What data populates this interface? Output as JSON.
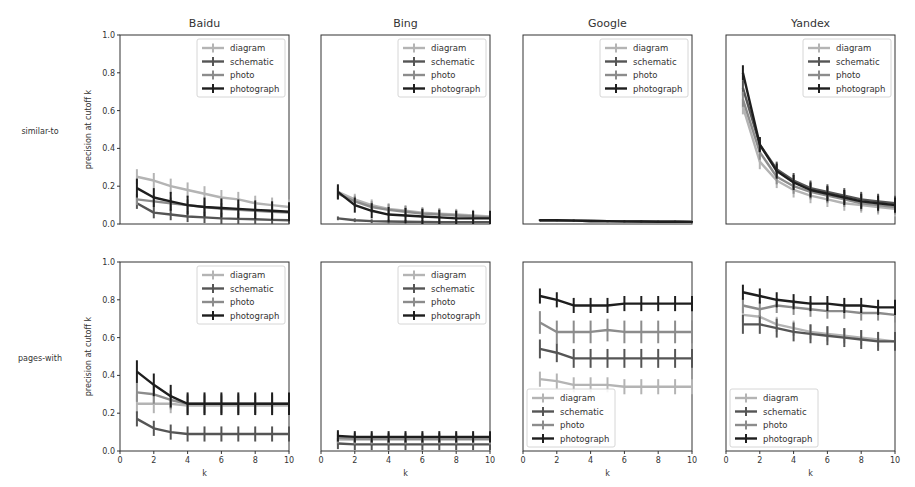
{
  "figure": {
    "row_labels": [
      "similar-to",
      "pages-with"
    ],
    "col_titles": [
      "Baidu",
      "Bing",
      "Google",
      "Yandex"
    ],
    "ylabel": "precision at cutoff k",
    "xlabel": "k",
    "yticks": [
      "0.0",
      "0.2",
      "0.4",
      "0.6",
      "0.8",
      "1.0"
    ],
    "xticks": [
      "0",
      "2",
      "4",
      "6",
      "8",
      "10"
    ]
  },
  "chart_data": {
    "type": "line",
    "layout": "grid 2 rows x 4 columns of errorbar line plots",
    "x": [
      1,
      2,
      3,
      4,
      5,
      6,
      7,
      8,
      9,
      10
    ],
    "xlim": [
      0,
      10
    ],
    "ylim": [
      0,
      1.0
    ],
    "grid": false,
    "series_names": [
      "diagram",
      "schematic",
      "photo",
      "photograph"
    ],
    "series_colors": {
      "diagram": "#b4b4b4",
      "schematic": "#555555",
      "photo": "#8c8c8c",
      "photograph": "#1e1e1e"
    },
    "panels": [
      {
        "row": "similar-to",
        "engine": "Baidu",
        "legend_position": "upper right",
        "series": [
          {
            "name": "diagram",
            "values": [
              0.25,
              0.23,
              0.2,
              0.18,
              0.16,
              0.14,
              0.13,
              0.11,
              0.1,
              0.09
            ],
            "err": 0.04
          },
          {
            "name": "schematic",
            "values": [
              0.11,
              0.06,
              0.05,
              0.04,
              0.035,
              0.03,
              0.027,
              0.025,
              0.022,
              0.02
            ],
            "err": 0.03
          },
          {
            "name": "photo",
            "values": [
              0.13,
              0.12,
              0.11,
              0.1,
              0.09,
              0.08,
              0.075,
              0.07,
              0.065,
              0.06
            ],
            "err": 0.03
          },
          {
            "name": "photograph",
            "values": [
              0.19,
              0.14,
              0.12,
              0.1,
              0.09,
              0.085,
              0.08,
              0.075,
              0.07,
              0.065
            ],
            "err": 0.05
          }
        ]
      },
      {
        "row": "similar-to",
        "engine": "Bing",
        "legend_position": "upper right",
        "series": [
          {
            "name": "diagram",
            "values": [
              0.17,
              0.13,
              0.1,
              0.08,
              0.07,
              0.06,
              0.055,
              0.05,
              0.045,
              0.04
            ],
            "err": 0.03
          },
          {
            "name": "schematic",
            "values": [
              0.03,
              0.02,
              0.015,
              0.013,
              0.012,
              0.011,
              0.01,
              0.01,
              0.01,
              0.01
            ],
            "err": 0.01
          },
          {
            "name": "photo",
            "values": [
              0.16,
              0.12,
              0.09,
              0.075,
              0.065,
              0.055,
              0.05,
              0.045,
              0.04,
              0.035
            ],
            "err": 0.03
          },
          {
            "name": "photograph",
            "values": [
              0.17,
              0.1,
              0.07,
              0.05,
              0.045,
              0.04,
              0.035,
              0.03,
              0.03,
              0.03
            ],
            "err": 0.04
          }
        ]
      },
      {
        "row": "similar-to",
        "engine": "Google",
        "legend_position": "upper right",
        "series": [
          {
            "name": "diagram",
            "values": [
              0.02,
              0.02,
              0.018,
              0.016,
              0.015,
              0.014,
              0.013,
              0.012,
              0.012,
              0.011
            ],
            "err": 0.005
          },
          {
            "name": "schematic",
            "values": [
              0.02,
              0.02,
              0.018,
              0.016,
              0.015,
              0.014,
              0.013,
              0.012,
              0.012,
              0.011
            ],
            "err": 0.005
          },
          {
            "name": "photo",
            "values": [
              0.02,
              0.02,
              0.018,
              0.016,
              0.015,
              0.014,
              0.013,
              0.012,
              0.012,
              0.011
            ],
            "err": 0.005
          },
          {
            "name": "photograph",
            "values": [
              0.02,
              0.02,
              0.018,
              0.016,
              0.015,
              0.014,
              0.013,
              0.012,
              0.012,
              0.011
            ],
            "err": 0.005
          }
        ]
      },
      {
        "row": "similar-to",
        "engine": "Yandex",
        "legend_position": "upper right",
        "series": [
          {
            "name": "diagram",
            "values": [
              0.62,
              0.33,
              0.23,
              0.18,
              0.15,
              0.13,
              0.11,
              0.1,
              0.09,
              0.08
            ],
            "err": 0.04
          },
          {
            "name": "schematic",
            "values": [
              0.72,
              0.42,
              0.29,
              0.23,
              0.19,
              0.17,
              0.15,
              0.13,
              0.12,
              0.11
            ],
            "err": 0.04
          },
          {
            "name": "photo",
            "values": [
              0.66,
              0.38,
              0.25,
              0.2,
              0.17,
              0.15,
              0.13,
              0.11,
              0.1,
              0.09
            ],
            "err": 0.04
          },
          {
            "name": "photograph",
            "values": [
              0.8,
              0.42,
              0.28,
              0.22,
              0.18,
              0.16,
              0.14,
              0.12,
              0.11,
              0.1
            ],
            "err": 0.04
          }
        ]
      },
      {
        "row": "pages-with",
        "engine": "Baidu",
        "legend_position": "upper right",
        "series": [
          {
            "name": "diagram",
            "values": [
              0.25,
              0.25,
              0.25,
              0.24,
              0.24,
              0.24,
              0.24,
              0.24,
              0.24,
              0.24
            ],
            "err": 0.05
          },
          {
            "name": "schematic",
            "values": [
              0.17,
              0.12,
              0.1,
              0.09,
              0.09,
              0.09,
              0.09,
              0.09,
              0.09,
              0.09
            ],
            "err": 0.04
          },
          {
            "name": "photo",
            "values": [
              0.31,
              0.3,
              0.27,
              0.25,
              0.25,
              0.25,
              0.25,
              0.25,
              0.25,
              0.25
            ],
            "err": 0.05
          },
          {
            "name": "photograph",
            "values": [
              0.42,
              0.35,
              0.29,
              0.25,
              0.25,
              0.25,
              0.25,
              0.25,
              0.25,
              0.25
            ],
            "err": 0.06
          }
        ]
      },
      {
        "row": "pages-with",
        "engine": "Bing",
        "legend_position": "upper right",
        "series": [
          {
            "name": "diagram",
            "values": [
              0.06,
              0.06,
              0.06,
              0.06,
              0.06,
              0.06,
              0.06,
              0.06,
              0.06,
              0.06
            ],
            "err": 0.03
          },
          {
            "name": "schematic",
            "values": [
              0.04,
              0.035,
              0.035,
              0.035,
              0.035,
              0.035,
              0.035,
              0.035,
              0.035,
              0.035
            ],
            "err": 0.03
          },
          {
            "name": "photo",
            "values": [
              0.07,
              0.065,
              0.065,
              0.065,
              0.065,
              0.065,
              0.065,
              0.065,
              0.065,
              0.065
            ],
            "err": 0.03
          },
          {
            "name": "photograph",
            "values": [
              0.08,
              0.075,
              0.075,
              0.075,
              0.075,
              0.075,
              0.075,
              0.075,
              0.075,
              0.075
            ],
            "err": 0.03
          }
        ]
      },
      {
        "row": "pages-with",
        "engine": "Google",
        "legend_position": "lower left",
        "series": [
          {
            "name": "diagram",
            "values": [
              0.38,
              0.37,
              0.35,
              0.35,
              0.35,
              0.34,
              0.34,
              0.34,
              0.34,
              0.34
            ],
            "err": 0.04
          },
          {
            "name": "schematic",
            "values": [
              0.54,
              0.52,
              0.49,
              0.49,
              0.49,
              0.49,
              0.49,
              0.49,
              0.49,
              0.49
            ],
            "err": 0.05
          },
          {
            "name": "photo",
            "values": [
              0.68,
              0.63,
              0.63,
              0.63,
              0.64,
              0.63,
              0.63,
              0.63,
              0.63,
              0.63
            ],
            "err": 0.06
          },
          {
            "name": "photograph",
            "values": [
              0.82,
              0.8,
              0.77,
              0.77,
              0.77,
              0.78,
              0.78,
              0.78,
              0.78,
              0.78
            ],
            "err": 0.04
          }
        ]
      },
      {
        "row": "pages-with",
        "engine": "Yandex",
        "legend_position": "lower left",
        "series": [
          {
            "name": "diagram",
            "values": [
              0.72,
              0.71,
              0.67,
              0.65,
              0.63,
              0.62,
              0.61,
              0.6,
              0.59,
              0.58
            ],
            "err": 0.04
          },
          {
            "name": "schematic",
            "values": [
              0.67,
              0.67,
              0.65,
              0.63,
              0.62,
              0.61,
              0.6,
              0.59,
              0.58,
              0.58
            ],
            "err": 0.05
          },
          {
            "name": "photo",
            "values": [
              0.77,
              0.75,
              0.77,
              0.76,
              0.75,
              0.74,
              0.74,
              0.73,
              0.73,
              0.72
            ],
            "err": 0.04
          },
          {
            "name": "photograph",
            "values": [
              0.84,
              0.82,
              0.8,
              0.79,
              0.78,
              0.78,
              0.77,
              0.77,
              0.76,
              0.76
            ],
            "err": 0.04
          }
        ]
      }
    ]
  }
}
